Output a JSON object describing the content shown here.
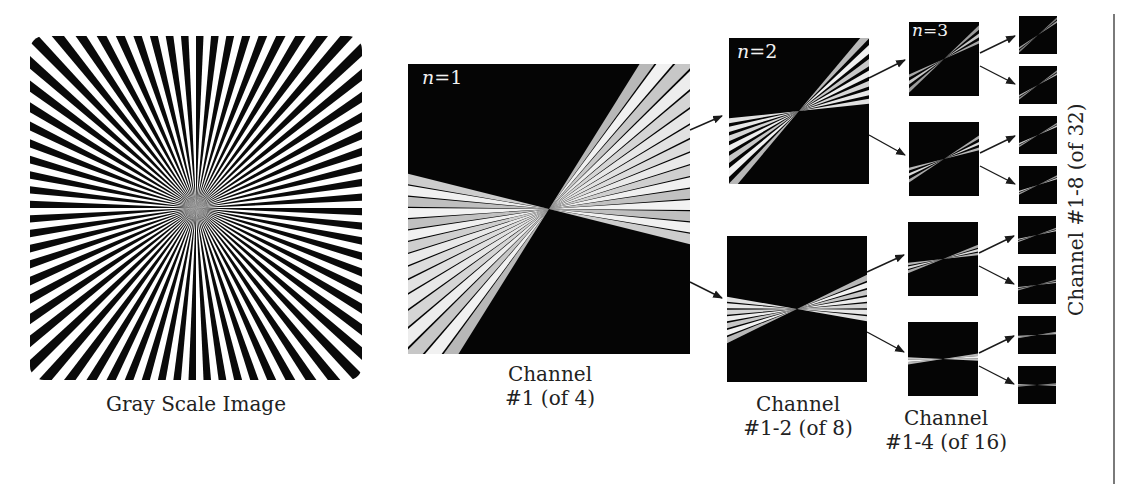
{
  "figure": {
    "source": {
      "label": "Gray Scale Image",
      "pattern": "radial-starburst"
    },
    "level1": {
      "n_label": "n=1",
      "n_var": "n",
      "n_value": "=1",
      "label_line1": "Channel",
      "label_line2": "#1 (of 4)"
    },
    "level2": {
      "n_var": "n",
      "n_value": "=2",
      "label_line1": "Channel",
      "label_line2": "#1-2 (of 8)"
    },
    "level3": {
      "n_var": "n",
      "n_value": "=3",
      "label_line1": "Channel",
      "label_line2": "#1-4 (of 16)"
    },
    "level4": {
      "label": "Channel #1-8 (of 32)",
      "count": 8
    },
    "colors": {
      "panel_background": "#050505",
      "arrow": "#1a1a1a",
      "divider": "#7a7a7a"
    }
  }
}
